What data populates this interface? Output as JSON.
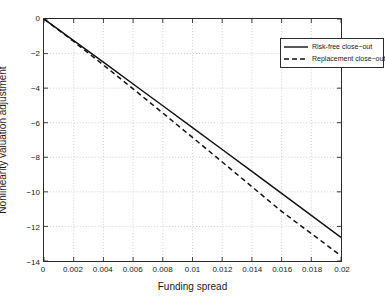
{
  "chart_data": {
    "type": "line",
    "title": "",
    "xlabel": "Funding spread",
    "ylabel": "Nonlinearity valuation adjustment",
    "xlim": [
      0,
      0.02
    ],
    "ylim": [
      -14,
      0
    ],
    "grid": true,
    "legend_position": "top-right",
    "xticks": [
      0,
      0.002,
      0.004,
      0.006,
      0.008,
      0.01,
      0.012,
      0.014,
      0.016,
      0.018,
      0.02
    ],
    "xticklabels": [
      "0",
      "0.002",
      "0.004",
      "0.006",
      "0.008",
      "0.01",
      "0.012",
      "0.014",
      "0.016",
      "0.018",
      "0.02"
    ],
    "yticks": [
      0,
      -2,
      -4,
      -6,
      -8,
      -10,
      -12,
      -14
    ],
    "yticklabels": [
      "0",
      "-2",
      "-4",
      "-6",
      "-8",
      "-10",
      "-12",
      "-14"
    ],
    "series": [
      {
        "name": "Risk-free close−out",
        "style": "solid",
        "color": "#111111",
        "x": [
          0,
          0.002,
          0.004,
          0.006,
          0.008,
          0.01,
          0.012,
          0.014,
          0.016,
          0.018,
          0.02
        ],
        "values": [
          0,
          -1.25,
          -2.5,
          -3.76,
          -5.02,
          -6.28,
          -7.55,
          -8.82,
          -10.09,
          -11.36,
          -12.63
        ]
      },
      {
        "name": "Replacement close−out",
        "style": "dashed",
        "color": "#111111",
        "x": [
          0,
          0.002,
          0.004,
          0.006,
          0.008,
          0.01,
          0.012,
          0.014,
          0.016,
          0.018,
          0.02
        ],
        "values": [
          0,
          -1.3,
          -2.66,
          -4.04,
          -5.44,
          -6.85,
          -8.27,
          -9.7,
          -11.13,
          -12.41,
          -13.7
        ]
      }
    ]
  },
  "axes": {
    "xlabel": "Funding spread",
    "ylabel": "Nonlinearity valuation adjustment"
  },
  "legend": {
    "entries": [
      {
        "label": "Risk-free close−out",
        "style": "solid"
      },
      {
        "label": "Replacement close−out",
        "style": "dashed"
      }
    ]
  },
  "colors": {
    "background": "#ffffff",
    "axis": "#2b2b2b",
    "grid": "#b9b9b9",
    "line": "#111111"
  }
}
